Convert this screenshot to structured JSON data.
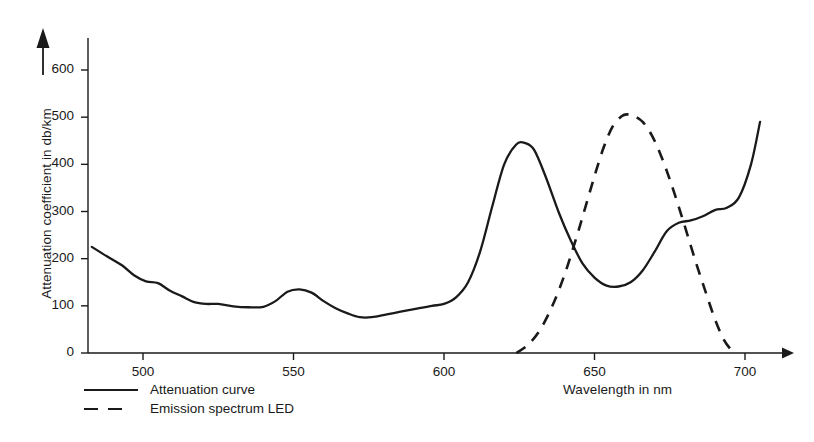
{
  "chart_data": {
    "type": "line",
    "title": "",
    "subtitle": "",
    "xlabel": "Wavelength in nm",
    "ylabel": "Attenuation coefficient in db/km",
    "xlim": [
      483,
      707
    ],
    "ylim": [
      0,
      640
    ],
    "xticks": [
      500,
      550,
      600,
      650,
      700
    ],
    "yticks": [
      0,
      100,
      200,
      300,
      400,
      500,
      600
    ],
    "xtick_labels": [
      "500",
      "550",
      "600",
      "650",
      "700"
    ],
    "ytick_labels": [
      "0",
      "100",
      "200",
      "300",
      "400",
      "500",
      "600"
    ],
    "grid": false,
    "legend_position": "below-left",
    "axis_arrows": {
      "x": "right",
      "y": "up"
    },
    "line_color": "#1a1a1a",
    "background": "#ffffff",
    "series": [
      {
        "name": "Attenuation curve",
        "style": "solid",
        "color": "#1a1a1a",
        "x": [
          483,
          488,
          493,
          497,
          501,
          505,
          509,
          513,
          517,
          521,
          525,
          530,
          535,
          540,
          544,
          548,
          552,
          556,
          560,
          564,
          568,
          572,
          576,
          581,
          586,
          591,
          596,
          600,
          604,
          608,
          612,
          616,
          620,
          624,
          627,
          630,
          634,
          638,
          642,
          646,
          650,
          654,
          658,
          662,
          666,
          670,
          674,
          678,
          682,
          686,
          690,
          694,
          698,
          702,
          705
        ],
        "y": [
          225,
          205,
          186,
          165,
          152,
          148,
          132,
          120,
          108,
          104,
          104,
          99,
          97,
          98,
          110,
          130,
          135,
          128,
          110,
          95,
          84,
          76,
          76,
          82,
          88,
          94,
          100,
          104,
          118,
          150,
          215,
          310,
          400,
          442,
          445,
          430,
          370,
          300,
          240,
          190,
          160,
          143,
          141,
          150,
          175,
          215,
          258,
          276,
          281,
          290,
          303,
          308,
          330,
          400,
          490
        ]
      },
      {
        "name": "Emission spectrum LED",
        "style": "dashed",
        "color": "#1a1a1a",
        "x": [
          624,
          628,
          632,
          636,
          640,
          644,
          647,
          650,
          653,
          656,
          659,
          661,
          663,
          666,
          669,
          672,
          675,
          678,
          681,
          684,
          687,
          690,
          693,
          696
        ],
        "y": [
          0,
          18,
          50,
          100,
          165,
          245,
          310,
          375,
          435,
          480,
          502,
          506,
          503,
          490,
          462,
          420,
          368,
          310,
          248,
          186,
          128,
          72,
          28,
          2
        ]
      }
    ],
    "annotations": {
      "attenuation_peak": {
        "x": 625,
        "y": 445
      },
      "attenuation_valley": {
        "x": 656,
        "y": 141
      },
      "led_peak": {
        "x": 661,
        "y": 506
      }
    }
  },
  "legend": {
    "items": [
      {
        "label": "Attenuation curve",
        "style": "solid"
      },
      {
        "label": "Emission spectrum LED",
        "style": "dashed"
      }
    ]
  }
}
